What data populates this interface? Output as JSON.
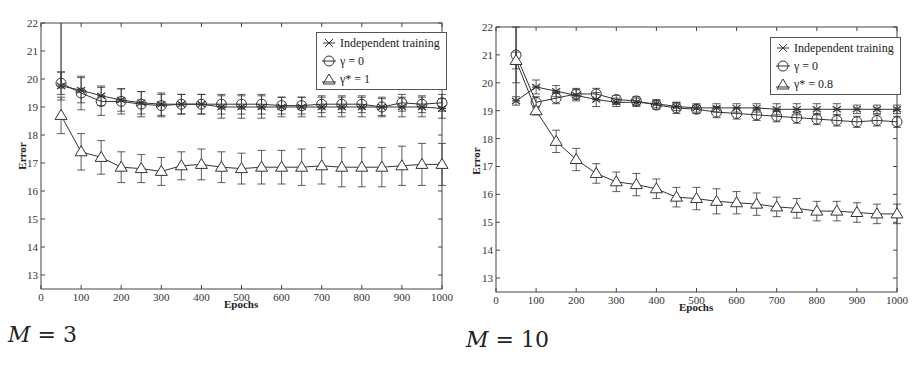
{
  "chart_data": [
    {
      "type": "line",
      "title": "",
      "caption": "M = 3",
      "xlabel": "Epochs",
      "ylabel": "Error",
      "xlim": [
        0,
        1000
      ],
      "ylim": [
        12.5,
        22
      ],
      "xticks": [
        0,
        100,
        200,
        300,
        400,
        500,
        600,
        700,
        800,
        900,
        1000
      ],
      "yticks": [
        13,
        14,
        15,
        16,
        17,
        18,
        19,
        20,
        21,
        22
      ],
      "grid": false,
      "legend_position": "upper right",
      "error_bars": true,
      "x": [
        50,
        100,
        150,
        200,
        250,
        300,
        350,
        400,
        450,
        500,
        550,
        600,
        650,
        700,
        750,
        800,
        850,
        900,
        950,
        1000
      ],
      "series": [
        {
          "name": "Independent training",
          "marker": "asterisk-x",
          "values": [
            19.75,
            19.6,
            19.4,
            19.25,
            19.15,
            19.1,
            19.1,
            19.1,
            19.0,
            19.0,
            19.0,
            19.0,
            19.0,
            19.0,
            19.0,
            19.0,
            19.0,
            19.0,
            19.0,
            18.95
          ],
          "err": [
            0.5,
            0.45,
            0.35,
            0.4,
            0.4,
            0.4,
            0.35,
            0.35,
            0.4,
            0.4,
            0.4,
            0.35,
            0.35,
            0.35,
            0.35,
            0.35,
            0.35,
            0.35,
            0.35,
            0.35
          ]
        },
        {
          "name": "γ = 0",
          "marker": "circle",
          "values": [
            19.85,
            19.5,
            19.2,
            19.2,
            19.1,
            19.05,
            19.1,
            19.1,
            19.1,
            19.1,
            19.1,
            19.05,
            19.05,
            19.1,
            19.1,
            19.1,
            19.0,
            19.15,
            19.1,
            19.15
          ],
          "err": [
            0.4,
            0.6,
            0.5,
            0.45,
            0.45,
            0.4,
            0.35,
            0.35,
            0.35,
            0.35,
            0.35,
            0.3,
            0.3,
            0.3,
            0.3,
            0.3,
            0.3,
            0.3,
            0.3,
            0.3
          ]
        },
        {
          "name": "γ* = 1",
          "marker": "triangle",
          "values": [
            18.7,
            17.4,
            17.2,
            16.85,
            16.8,
            16.7,
            16.9,
            16.95,
            16.85,
            16.8,
            16.85,
            16.85,
            16.85,
            16.9,
            16.85,
            16.85,
            16.85,
            16.9,
            16.95,
            16.95
          ],
          "err": [
            0.65,
            0.65,
            0.6,
            0.55,
            0.5,
            0.5,
            0.5,
            0.55,
            0.55,
            0.55,
            0.6,
            0.6,
            0.65,
            0.65,
            0.7,
            0.7,
            0.7,
            0.7,
            0.75,
            0.75
          ]
        }
      ]
    },
    {
      "type": "line",
      "title": "",
      "caption": "M = 10",
      "xlabel": "Epochs",
      "ylabel": "Error",
      "xlim": [
        0,
        1000
      ],
      "ylim": [
        12.5,
        22
      ],
      "xticks": [
        0,
        100,
        200,
        300,
        400,
        500,
        600,
        700,
        800,
        900,
        1000
      ],
      "yticks": [
        13,
        14,
        15,
        16,
        17,
        18,
        19,
        20,
        21,
        22
      ],
      "grid": false,
      "legend_position": "upper right",
      "error_bars": true,
      "x": [
        50,
        100,
        150,
        200,
        250,
        300,
        350,
        400,
        450,
        500,
        550,
        600,
        650,
        700,
        750,
        800,
        850,
        900,
        950,
        1000
      ],
      "series": [
        {
          "name": "Independent training",
          "marker": "asterisk-x",
          "values": [
            19.35,
            19.85,
            19.7,
            19.55,
            19.4,
            19.3,
            19.3,
            19.25,
            19.15,
            19.1,
            19.1,
            19.1,
            19.1,
            19.05,
            19.05,
            19.05,
            19.05,
            19.05,
            19.05,
            19.05
          ],
          "err": [
            0.15,
            0.25,
            0.2,
            0.2,
            0.25,
            0.15,
            0.15,
            0.15,
            0.15,
            0.15,
            0.15,
            0.15,
            0.15,
            0.2,
            0.2,
            0.2,
            0.2,
            0.15,
            0.15,
            0.15
          ]
        },
        {
          "name": "γ = 0",
          "marker": "circle",
          "values": [
            21.0,
            19.3,
            19.45,
            19.6,
            19.6,
            19.4,
            19.35,
            19.2,
            19.1,
            19.05,
            18.95,
            18.9,
            18.85,
            18.8,
            18.75,
            18.7,
            18.65,
            18.6,
            18.65,
            18.6
          ],
          "err": [
            1.0,
            0.2,
            0.2,
            0.2,
            0.2,
            0.15,
            0.15,
            0.15,
            0.2,
            0.15,
            0.2,
            0.2,
            0.2,
            0.2,
            0.2,
            0.2,
            0.2,
            0.2,
            0.2,
            0.2
          ]
        },
        {
          "name": "γ* = 0.8",
          "marker": "triangle",
          "values": [
            20.8,
            19.0,
            17.9,
            17.25,
            16.75,
            16.45,
            16.35,
            16.2,
            15.9,
            15.85,
            15.75,
            15.7,
            15.65,
            15.55,
            15.5,
            15.4,
            15.4,
            15.35,
            15.3,
            15.3
          ],
          "err": [
            0.3,
            0.15,
            0.4,
            0.4,
            0.35,
            0.35,
            0.4,
            0.35,
            0.35,
            0.4,
            0.45,
            0.4,
            0.4,
            0.35,
            0.35,
            0.35,
            0.35,
            0.35,
            0.35,
            0.35
          ]
        }
      ]
    }
  ],
  "panels": [
    {
      "caption": "M = 3",
      "caption_var": "M",
      "caption_eq": " = 3",
      "xlabel": "Epochs",
      "ylabel": "Error",
      "legend": [
        "Independent training",
        "γ = 0",
        "γ* = 1"
      ]
    },
    {
      "caption": "M = 10",
      "caption_var": "M",
      "caption_eq": " = 10",
      "xlabel": "Epochs",
      "ylabel": "Error",
      "legend": [
        "Independent training",
        "γ = 0",
        "γ* = 0.8"
      ]
    }
  ],
  "colors": {
    "line": "#333333",
    "axis": "#444444",
    "background": "#ffffff"
  }
}
